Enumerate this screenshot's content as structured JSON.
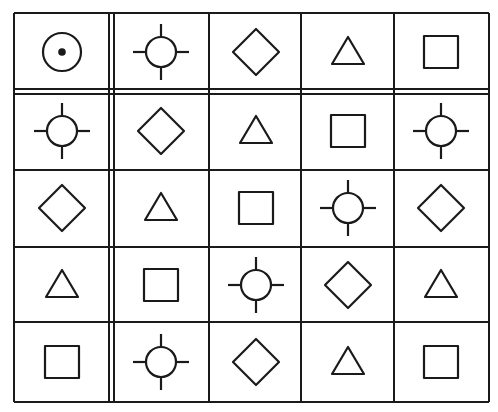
{
  "grid": {
    "rows": 5,
    "cols": 5,
    "line_color": "#1a1a1a",
    "stroke_width": 2,
    "col_lines": [
      14,
      109,
      114,
      209,
      301,
      394,
      489
    ],
    "row_lines": [
      13,
      89,
      94,
      170,
      247,
      322,
      402
    ],
    "col_centers": [
      62,
      161,
      256,
      348,
      441
    ],
    "row_centers": [
      52,
      131,
      208,
      285,
      362
    ],
    "double_line_after_col": 1,
    "double_line_after_row": 1
  },
  "cells": [
    [
      "circle-dot",
      "crosshair",
      "diamond",
      "triangle",
      "square"
    ],
    [
      "crosshair",
      "diamond",
      "triangle",
      "square",
      "crosshair"
    ],
    [
      "diamond",
      "triangle",
      "square",
      "crosshair",
      "diamond"
    ],
    [
      "triangle",
      "square",
      "crosshair",
      "diamond",
      "triangle"
    ],
    [
      "square",
      "crosshair",
      "diamond",
      "triangle",
      "square"
    ]
  ],
  "shape_legend": {
    "circle-dot": "circle with center dot",
    "crosshair": "circle with four tick marks",
    "diamond": "diamond",
    "triangle": "triangle",
    "square": "square"
  }
}
